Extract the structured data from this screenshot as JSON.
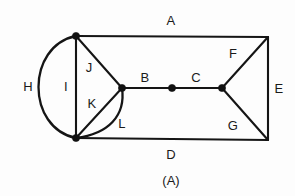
{
  "figure": {
    "caption": "(A)",
    "caption_x": 171,
    "caption_y": 180,
    "background_color": "#fdfdfd",
    "stroke_color": "#151515",
    "label_color": "#1a1a1a"
  },
  "geometry": {
    "vertices": [
      {
        "name": "top-left",
        "x": 76,
        "y": 36,
        "dot": true
      },
      {
        "name": "bottom-left",
        "x": 76,
        "y": 138,
        "dot": true
      },
      {
        "name": "top-right",
        "x": 268,
        "y": 37,
        "dot": false
      },
      {
        "name": "bottom-right",
        "x": 268,
        "y": 140,
        "dot": false
      },
      {
        "name": "left-middle",
        "x": 122,
        "y": 88,
        "dot": true
      },
      {
        "name": "center",
        "x": 172,
        "y": 88,
        "dot": true
      },
      {
        "name": "right-middle",
        "x": 222,
        "y": 88,
        "dot": true
      }
    ],
    "edges": [
      {
        "id": "A",
        "kind": "line",
        "path": "M 76 36 L 268 37"
      },
      {
        "id": "D",
        "kind": "line",
        "path": "M 76 138 L 268 140"
      },
      {
        "id": "E",
        "kind": "line",
        "path": "M 268 37 L 268 140"
      },
      {
        "id": "I",
        "kind": "line",
        "path": "M 76 36 L 76 138"
      },
      {
        "id": "J",
        "kind": "line",
        "path": "M 76 36 L 122 88"
      },
      {
        "id": "K",
        "kind": "line",
        "path": "M 76 138 L 122 88"
      },
      {
        "id": "B",
        "kind": "line",
        "path": "M 122 88 L 172 88"
      },
      {
        "id": "C",
        "kind": "line",
        "path": "M 172 88 L 222 88"
      },
      {
        "id": "F",
        "kind": "line",
        "path": "M 222 88 L 268 37"
      },
      {
        "id": "G",
        "kind": "line",
        "path": "M 222 88 L 268 140"
      },
      {
        "id": "H",
        "kind": "arc",
        "path": "M 76 36 C 26 46 26 128 76 138"
      },
      {
        "id": "L",
        "kind": "arc",
        "path": "M 122 88 C 126 116 108 134 76 138"
      }
    ]
  },
  "labels": [
    {
      "id": "A",
      "text": "A",
      "x": 171,
      "y": 20
    },
    {
      "id": "H",
      "text": "H",
      "x": 28,
      "y": 86
    },
    {
      "id": "I",
      "text": "I",
      "x": 66,
      "y": 86
    },
    {
      "id": "J",
      "text": "J",
      "x": 89,
      "y": 67
    },
    {
      "id": "K",
      "text": "K",
      "x": 92,
      "y": 103
    },
    {
      "id": "L",
      "text": "L",
      "x": 122,
      "y": 123
    },
    {
      "id": "B",
      "text": "B",
      "x": 145,
      "y": 77
    },
    {
      "id": "C",
      "text": "C",
      "x": 196,
      "y": 77
    },
    {
      "id": "F",
      "text": "F",
      "x": 233,
      "y": 53
    },
    {
      "id": "G",
      "text": "G",
      "x": 233,
      "y": 125
    },
    {
      "id": "E",
      "text": "E",
      "x": 279,
      "y": 88
    },
    {
      "id": "D",
      "text": "D",
      "x": 171,
      "y": 154
    }
  ],
  "chart_data": {
    "type": "diagram",
    "title": "(A)",
    "regions": [
      "A",
      "B",
      "C",
      "D",
      "E",
      "F",
      "G",
      "H",
      "I",
      "J",
      "K",
      "L"
    ],
    "node_count": 7,
    "edge_count": 12
  }
}
